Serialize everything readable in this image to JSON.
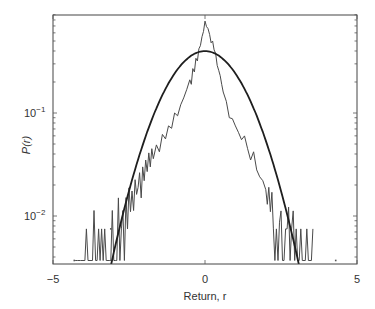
{
  "chart_data": {
    "type": "line",
    "title": "",
    "xlabel": "Return, r",
    "ylabel": "P(r)",
    "xlim": [
      -5,
      5
    ],
    "ylim": [
      0.0034,
      0.9
    ],
    "yscale": "log",
    "grid": false,
    "legend": null,
    "xticks": [
      -5,
      0,
      5
    ],
    "xtick_labels": [
      "−5",
      "0",
      "5"
    ],
    "yticks": [
      0.01,
      0.1
    ],
    "ytick_labels": [
      "10",
      "10"
    ],
    "ytick_exponents": [
      "−2",
      "−1"
    ],
    "series": [
      {
        "name": "Empirical distribution",
        "style": "thin jagged line",
        "color": "#444444",
        "x": [
          -4.3,
          -4.25,
          -4.2,
          -4.1,
          -3.95,
          -3.9,
          -3.85,
          -3.75,
          -3.7,
          -3.65,
          -3.6,
          -3.55,
          -3.5,
          -3.45,
          -3.4,
          -3.35,
          -3.3,
          -3.25,
          -3.15,
          -3.1,
          -3.05,
          -3.0,
          -2.95,
          -2.9,
          -2.85,
          -2.8,
          -2.75,
          -2.7,
          -2.65,
          -2.6,
          -2.55,
          -2.5,
          -2.45,
          -2.4,
          -2.35,
          -2.3,
          -2.25,
          -2.2,
          -2.15,
          -2.1,
          -2.05,
          -2.0,
          -1.95,
          -1.9,
          -1.85,
          -1.8,
          -1.75,
          -1.7,
          -1.6,
          -1.5,
          -1.4,
          -1.3,
          -1.2,
          -1.1,
          -1.0,
          -0.9,
          -0.8,
          -0.7,
          -0.6,
          -0.5,
          -0.45,
          -0.4,
          -0.35,
          -0.3,
          -0.25,
          -0.2,
          -0.15,
          -0.1,
          -0.05,
          0.0,
          0.05,
          0.1,
          0.15,
          0.2,
          0.25,
          0.3,
          0.35,
          0.4,
          0.45,
          0.5,
          0.55,
          0.6,
          0.7,
          0.8,
          0.9,
          1.0,
          1.1,
          1.2,
          1.3,
          1.4,
          1.5,
          1.6,
          1.7,
          1.8,
          1.9,
          2.0,
          2.05,
          2.1,
          2.15,
          2.2,
          2.25,
          2.3,
          2.35,
          2.4,
          2.45,
          2.5,
          2.55,
          2.6,
          2.65,
          2.7,
          2.75,
          2.8,
          2.85,
          2.9,
          2.95,
          3.0,
          3.05,
          3.1,
          3.15,
          3.2,
          3.3,
          3.35,
          3.4,
          3.5,
          3.55
        ],
        "y": [
          0.0037,
          0.0037,
          0.0037,
          0.0037,
          0.0037,
          0.0075,
          0.0037,
          0.0037,
          0.0037,
          0.0113,
          0.0037,
          0.0037,
          0.0075,
          0.0037,
          0.0075,
          0.0037,
          0.0075,
          0.0037,
          0.0037,
          0.0037,
          0.0113,
          0.0037,
          0.0037,
          0.0037,
          0.015,
          0.0037,
          0.0075,
          0.0113,
          0.0037,
          0.0151,
          0.0075,
          0.0188,
          0.011,
          0.0175,
          0.0113,
          0.0225,
          0.0162,
          0.019,
          0.0263,
          0.015,
          0.03,
          0.022,
          0.035,
          0.027,
          0.041,
          0.03,
          0.045,
          0.036,
          0.049,
          0.042,
          0.062,
          0.056,
          0.075,
          0.071,
          0.1,
          0.094,
          0.12,
          0.14,
          0.17,
          0.21,
          0.19,
          0.27,
          0.25,
          0.34,
          0.32,
          0.42,
          0.45,
          0.55,
          0.62,
          0.78,
          0.69,
          0.66,
          0.58,
          0.48,
          0.5,
          0.41,
          0.38,
          0.29,
          0.26,
          0.23,
          0.19,
          0.16,
          0.13,
          0.09,
          0.088,
          0.075,
          0.065,
          0.055,
          0.06,
          0.045,
          0.035,
          0.042,
          0.028,
          0.024,
          0.022,
          0.018,
          0.013,
          0.019,
          0.011,
          0.017,
          0.0075,
          0.0037,
          0.0075,
          0.0037,
          0.0087,
          0.0112,
          0.0037,
          0.0037,
          0.0075,
          0.0075,
          0.0122,
          0.0037,
          0.0075,
          0.0112,
          0.0037,
          0.0075,
          0.0037,
          0.0037,
          0.0075,
          0.0037,
          0.0037,
          0.0075,
          0.0037,
          0.0037,
          0.0075
        ]
      },
      {
        "name": "Gaussian (normal) fit",
        "style": "thick smooth line",
        "color": "#222222",
        "function": "exp(-r^2/2)/sqrt(2*pi)",
        "x": [
          -3.1,
          -3.0,
          -2.5,
          -2.0,
          -1.5,
          -1.0,
          -0.5,
          0.0,
          0.5,
          1.0,
          1.5,
          2.0,
          2.5,
          3.0,
          3.1
        ],
        "y": [
          0.0033,
          0.0044,
          0.0175,
          0.054,
          0.1295,
          0.242,
          0.352,
          0.399,
          0.352,
          0.242,
          0.1295,
          0.054,
          0.0175,
          0.0044,
          0.0033
        ]
      }
    ],
    "annotations": [
      {
        "type": "point",
        "x": -4.3,
        "y": 0.0037
      },
      {
        "type": "point",
        "x": -3.1,
        "y": 0.0075
      },
      {
        "type": "point",
        "x": 4.3,
        "y": 0.0037
      }
    ]
  }
}
